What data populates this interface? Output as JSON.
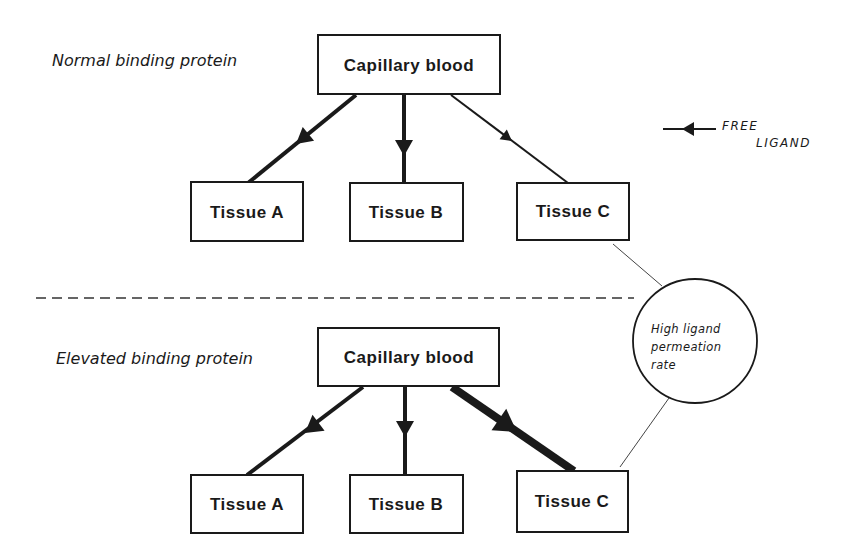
{
  "panels": [
    {
      "label": "Normal binding protein",
      "source": "Capillary blood",
      "targets": [
        {
          "name": "Tissue A",
          "flow_weight": "medium"
        },
        {
          "name": "Tissue B",
          "flow_weight": "medium"
        },
        {
          "name": "Tissue C",
          "flow_weight": "thin"
        }
      ]
    },
    {
      "label": "Elevated binding protein",
      "source": "Capillary blood",
      "targets": [
        {
          "name": "Tissue A",
          "flow_weight": "medium"
        },
        {
          "name": "Tissue B",
          "flow_weight": "medium"
        },
        {
          "name": "Tissue C",
          "flow_weight": "heavy"
        }
      ]
    }
  ],
  "legend": {
    "line1": "FREE",
    "line2": "LIGAND"
  },
  "callout": {
    "lines": [
      "High ligand",
      "permeation",
      "rate"
    ]
  },
  "colors": {
    "ink": "#1a1a1a",
    "background": "#ffffff"
  }
}
